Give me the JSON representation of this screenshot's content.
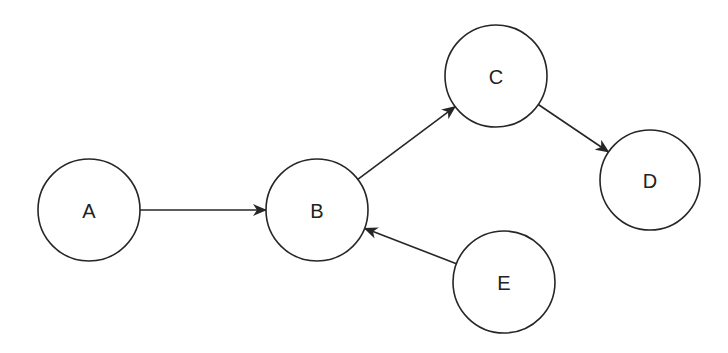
{
  "diagram": {
    "type": "directed-graph",
    "colors": {
      "background": "#ffffff",
      "stroke": "#262626",
      "text": "#222222"
    },
    "nodes": [
      {
        "id": "A",
        "label": "A",
        "cx": 89,
        "cy": 210,
        "r": 51
      },
      {
        "id": "B",
        "label": "B",
        "cx": 317,
        "cy": 210,
        "r": 51
      },
      {
        "id": "C",
        "label": "C",
        "cx": 496,
        "cy": 76,
        "r": 51
      },
      {
        "id": "D",
        "label": "D",
        "cx": 650,
        "cy": 180,
        "r": 50
      },
      {
        "id": "E",
        "label": "E",
        "cx": 504,
        "cy": 282,
        "r": 51
      }
    ],
    "edges": [
      {
        "from": "A",
        "to": "B"
      },
      {
        "from": "B",
        "to": "C"
      },
      {
        "from": "C",
        "to": "D"
      },
      {
        "from": "E",
        "to": "B"
      }
    ]
  }
}
